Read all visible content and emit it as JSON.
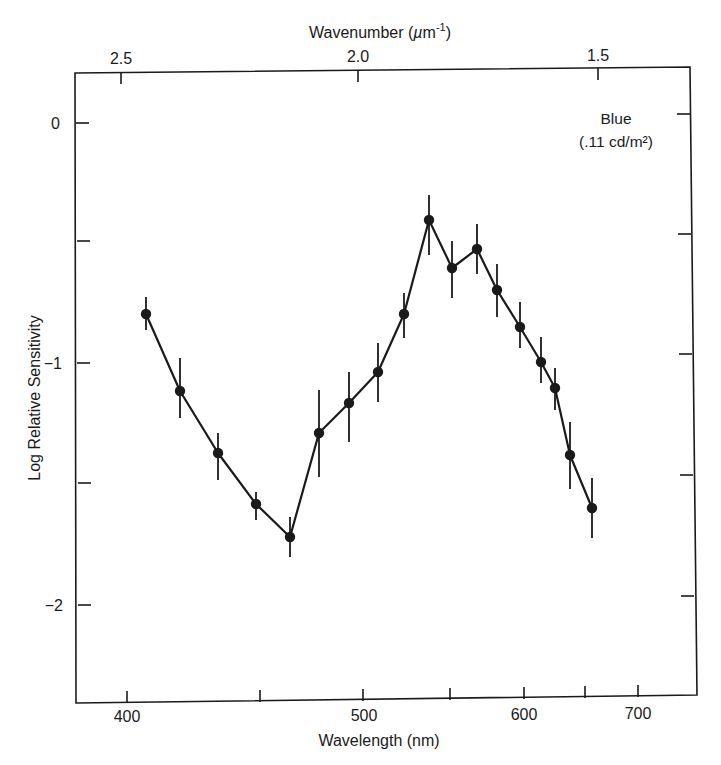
{
  "chart_data": {
    "type": "line",
    "title": "",
    "xlabel": "Wavelength (nm)",
    "ylabel": "Log Relative Sensitivity",
    "x2label": "Wavenumber (µm⁻¹)",
    "x_scale": "wavenumber-linear (reciprocal wavelength)",
    "xticks": [
      {
        "value": 400,
        "label": "400"
      },
      {
        "value": 450,
        "label": ""
      },
      {
        "value": 500,
        "label": "500"
      },
      {
        "value": 550,
        "label": ""
      },
      {
        "value": 600,
        "label": "600"
      },
      {
        "value": 650,
        "label": ""
      },
      {
        "value": 700,
        "label": "700"
      }
    ],
    "x2ticks": [
      {
        "value": 2.5,
        "label": "2.5"
      },
      {
        "value": 2.0,
        "label": "2.0"
      },
      {
        "value": 1.5,
        "label": "1.5"
      }
    ],
    "yticks": [
      {
        "value": 0,
        "label": "0"
      },
      {
        "value": -0.5,
        "label": ""
      },
      {
        "value": -1,
        "label": "−1"
      },
      {
        "value": -1.5,
        "label": ""
      },
      {
        "value": -2,
        "label": "−2"
      }
    ],
    "ylim": [
      -2.4,
      0.2
    ],
    "xlim_wavenumber": [
      2.6,
      1.3
    ],
    "grid": false,
    "legend": null,
    "annotation": {
      "line1": "Blue",
      "line2": "(.11 cd/m²)"
    },
    "series": [
      {
        "name": "Blue (.11 cd/m²)",
        "marker": "filled-circle",
        "error_bars": true,
        "x": [
          408,
          420,
          435,
          450,
          465,
          479,
          494,
          509,
          524,
          538,
          553,
          569,
          583,
          600,
          616,
          627,
          640,
          659
        ],
        "y": [
          -0.8,
          -1.12,
          -1.38,
          -1.59,
          -1.73,
          -1.3,
          -1.18,
          -1.05,
          -0.81,
          -0.43,
          -0.62,
          -0.55,
          -0.72,
          -0.87,
          -1.02,
          -1.13,
          -1.41,
          -1.63
        ],
        "err": [
          0.07,
          0.13,
          0.1,
          0.06,
          0.08,
          0.18,
          0.15,
          0.12,
          0.09,
          0.11,
          0.12,
          0.1,
          0.11,
          0.1,
          0.1,
          0.09,
          0.14,
          0.13
        ]
      }
    ]
  },
  "render": {
    "frame": {
      "tl": [
        75,
        73
      ],
      "tr": [
        690,
        67
      ],
      "br": [
        697,
        695
      ],
      "bl": [
        76,
        703
      ]
    },
    "points_px": [
      [
        146,
        314,
        297,
        330
      ],
      [
        180,
        391,
        358,
        418
      ],
      [
        218,
        453,
        433,
        480
      ],
      [
        256,
        504,
        492,
        520
      ],
      [
        290,
        537,
        517,
        557
      ],
      [
        319,
        433,
        390,
        477
      ],
      [
        349,
        403,
        372,
        442
      ],
      [
        378,
        372,
        343,
        402
      ],
      [
        404,
        314,
        293,
        338
      ],
      [
        429,
        220,
        195,
        255
      ],
      [
        452,
        268,
        241,
        298
      ],
      [
        477,
        249,
        224,
        274
      ],
      [
        497,
        290,
        264,
        317
      ],
      [
        520,
        327,
        302,
        348
      ],
      [
        541,
        362,
        337,
        383
      ],
      [
        555,
        388,
        368,
        410
      ],
      [
        570,
        455,
        422,
        489
      ],
      [
        592,
        508,
        478,
        538
      ]
    ],
    "bottom_ticks_px": [
      [
        127,
        703
      ],
      [
        260,
        702
      ],
      [
        363,
        701
      ],
      [
        450,
        700
      ],
      [
        524,
        699
      ],
      [
        585,
        698
      ],
      [
        638,
        697
      ]
    ],
    "top_ticks_px": [
      [
        121,
        72
      ],
      [
        358,
        70
      ],
      [
        598,
        68
      ]
    ],
    "left_ticks_px": [
      [
        76,
        123
      ],
      [
        77,
        241
      ],
      [
        77,
        363
      ],
      [
        78,
        483
      ],
      [
        78,
        605
      ]
    ],
    "right_ticks_px": [
      [
        690,
        114
      ],
      [
        691,
        234
      ],
      [
        692,
        354
      ],
      [
        693,
        475
      ],
      [
        694,
        596
      ]
    ]
  }
}
